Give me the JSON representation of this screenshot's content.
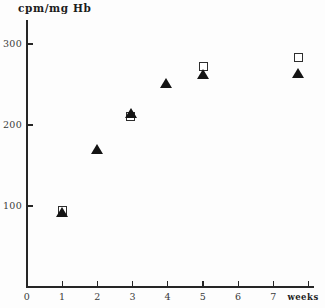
{
  "chart_data": {
    "type": "scatter",
    "title": "",
    "xlabel": "weeks",
    "ylabel": "cpm/mg Hb",
    "xlim": [
      0,
      8.2
    ],
    "ylim": [
      0,
      330
    ],
    "grid": false,
    "legend": "none",
    "xticks": [
      "0",
      "1",
      "2",
      "3",
      "4",
      "5",
      "6",
      "7"
    ],
    "xtick_values": [
      0,
      1,
      2,
      3,
      4,
      5,
      6,
      7
    ],
    "yticks": [
      "100",
      "200",
      "300"
    ],
    "ytick_values": [
      100,
      200,
      300
    ],
    "series": [
      {
        "name": "open-square-series",
        "marker": "open-square",
        "color": "#2e2e2e",
        "points": [
          {
            "x": 1,
            "y": 95
          },
          {
            "x": 2.95,
            "y": 210
          },
          {
            "x": 5,
            "y": 272
          },
          {
            "x": 7.7,
            "y": 283
          }
        ]
      },
      {
        "name": "filled-triangle-series",
        "marker": "filled-triangle",
        "color": "#141414",
        "points": [
          {
            "x": 1,
            "y": 92
          },
          {
            "x": 2,
            "y": 170
          },
          {
            "x": 2.95,
            "y": 215
          },
          {
            "x": 3.95,
            "y": 252
          },
          {
            "x": 5,
            "y": 263
          },
          {
            "x": 7.7,
            "y": 264
          }
        ]
      }
    ]
  },
  "axes": {
    "y_axis_title": "cpm/mg Hb",
    "x_axis_title": "weeks"
  }
}
